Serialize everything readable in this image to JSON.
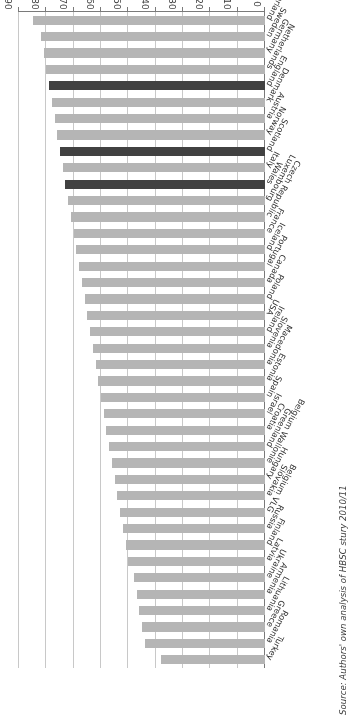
{
  "chart_data": {
    "type": "bar",
    "orientation": "horizontal",
    "title": "",
    "subtitle": "",
    "xlabel": "",
    "ylabel": "%",
    "ylim": [
      0,
      90
    ],
    "xlim": [
      0,
      90
    ],
    "grid": true,
    "legend_position": "none",
    "tick_labels": [
      "0",
      "10",
      "20",
      "30",
      "40",
      "50",
      "60",
      "70",
      "80",
      "90"
    ],
    "tick_values": [
      0,
      10,
      20,
      30,
      40,
      50,
      60,
      70,
      80,
      90
    ],
    "axis_unit_label": "%",
    "highlight_color": "#414141",
    "bar_color": "#b5b5b5",
    "gridline_color": "#c8c8c8",
    "axis_color": "#7a7a7a",
    "highlighted_categories": [
      "England",
      "Scotland",
      "Wales"
    ],
    "categories": [
      "Switzerland",
      "Sweden",
      "Germany",
      "Netherlands",
      "England",
      "Denmark",
      "Austria",
      "Norway",
      "Scotland",
      "Italy",
      "Wales",
      "Luxembourg",
      "Czech Republic",
      "France",
      "Iceland",
      "Portugal",
      "Canada",
      "Poland",
      "USA",
      "Ireland",
      "Slovenia",
      "Macedonia",
      "Estonia",
      "Spain",
      "Israel",
      "Croatia",
      "Greenland",
      "Belgium Wallonie",
      "Hungary",
      "Slovakia",
      "Belgium VLG",
      "Russia",
      "Finland",
      "Latvia",
      "Ukraine",
      "Armenia",
      "Lithuania",
      "Greece",
      "Romania",
      "Turkey"
    ],
    "values": [
      85,
      82,
      81,
      80,
      79,
      78,
      77,
      76,
      75,
      74,
      73,
      72,
      71,
      70,
      69,
      68,
      67,
      66,
      65,
      64,
      63,
      62,
      61,
      60,
      59,
      58,
      57,
      56,
      55,
      54,
      53,
      52,
      51,
      50,
      48,
      47,
      46,
      45,
      44,
      38
    ],
    "series": [
      {
        "name": "Percentage",
        "values": [
          85,
          82,
          81,
          80,
          79,
          78,
          77,
          76,
          75,
          74,
          73,
          72,
          71,
          70,
          69,
          68,
          67,
          66,
          65,
          64,
          63,
          62,
          61,
          60,
          59,
          58,
          57,
          56,
          55,
          54,
          53,
          52,
          51,
          50,
          48,
          47,
          46,
          45,
          44,
          38
        ]
      }
    ],
    "annotations": []
  },
  "source_note": "Source: Authors' own analysis of HBSC stury 2010/11"
}
